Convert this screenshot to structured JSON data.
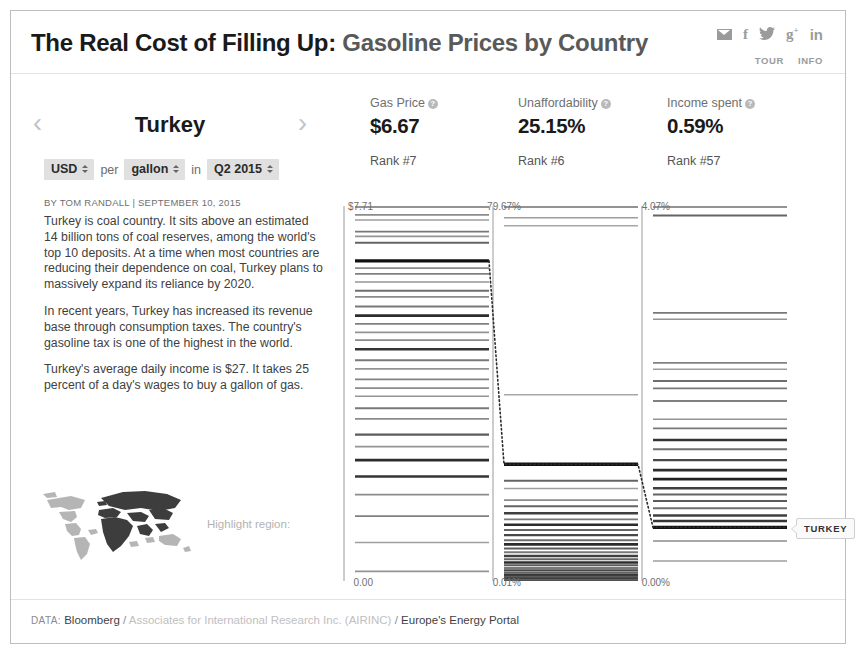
{
  "header": {
    "title_main": "The Real Cost of Filling Up:",
    "title_sub": " Gasoline Prices by Country",
    "social": [
      {
        "name": "mail-icon",
        "label": ""
      },
      {
        "name": "facebook-icon",
        "label": "f"
      },
      {
        "name": "twitter-icon",
        "label": "ᴗ"
      },
      {
        "name": "googleplus-icon",
        "label": "g"
      },
      {
        "name": "linkedin-icon",
        "label": "in"
      }
    ],
    "links": [
      "TOUR",
      "INFO"
    ]
  },
  "left": {
    "prev_arrow": "‹",
    "next_arrow": "›",
    "country": "Turkey",
    "selects": {
      "currency": "USD",
      "per_label": "per",
      "unit": "gallon",
      "in_label": "in",
      "period": "Q2 2015"
    },
    "byline": "BY TOM RANDALL | SEPTEMBER 10, 2015",
    "paragraphs": [
      "Turkey is coal country. It sits above an estimated 14 billion tons of coal reserves, among the world's top 10 deposits. At a time when most countries are reducing their dependence on coal, Turkey plans to massively expand its reliance by 2020.",
      "In recent years, Turkey has increased its revenue base through consumption taxes. The country's gasoline tax is one of the highest in the world.",
      "Turkey's average daily income is $27. It takes 25 percent of a day's wages to buy a gallon of gas."
    ],
    "map_label": "Highlight region:"
  },
  "footer": {
    "key": "DATA:",
    "source1": "Bloomberg",
    "sep1": "/",
    "source2": "Associates for International Research Inc. (AIRINC)",
    "sep2": "/",
    "source3": "Europe's Energy Portal"
  },
  "highlight_tooltip": "TURKEY",
  "chart_data": {
    "type": "table",
    "title": "The Real Cost of Filling Up: Gasoline Prices by Country",
    "subtitle": "Turkey — USD per gallon in Q2 2015",
    "grid": false,
    "legend": "none",
    "highlight_country": "Turkey",
    "columns": [
      {
        "id": "gas_price",
        "label": "Gas Price",
        "value": "$6.67",
        "value_num": 6.67,
        "rank_label": "Rank #7",
        "rank": 7,
        "axis_top": "$7.71",
        "axis_top_num": 7.71,
        "axis_bottom": "0.00",
        "axis_bottom_num": 0.0,
        "ylim": [
          0.0,
          7.71
        ],
        "highlight_value": 6.67,
        "tick_values": [
          7.63,
          7.52,
          7.28,
          7.18,
          7.05,
          6.67,
          6.52,
          6.4,
          6.23,
          6.05,
          5.92,
          5.72,
          5.53,
          5.36,
          5.18,
          5.02,
          4.83,
          4.6,
          4.42,
          4.2,
          4.02,
          3.85,
          3.6,
          3.38,
          3.05,
          2.8,
          2.52,
          2.18,
          1.8,
          1.35,
          0.8,
          0.2
        ],
        "tick_weights": [
          0.35,
          0.25,
          0.45,
          0.3,
          0.55,
          1.0,
          0.35,
          0.4,
          0.3,
          0.5,
          0.35,
          0.45,
          0.85,
          0.4,
          0.3,
          0.35,
          0.8,
          0.45,
          0.3,
          0.4,
          0.35,
          0.3,
          0.45,
          0.35,
          0.6,
          0.3,
          0.85,
          0.8,
          0.35,
          0.4,
          0.25,
          0.3
        ]
      },
      {
        "id": "unaffordability",
        "label": "Unaffordability",
        "value": "25.15%",
        "value_num": 25.15,
        "rank_label": "Rank #6",
        "rank": 6,
        "axis_top": "79.67%",
        "axis_top_num": 79.67,
        "axis_bottom": "0.01%",
        "axis_bottom_num": 0.01,
        "ylim": [
          0.01,
          79.67
        ],
        "highlight_value": 25.15,
        "tick_values": [
          78.2,
          76.5,
          40.1,
          25.15,
          21.6,
          19.9,
          17.4,
          16.1,
          14.6,
          13.3,
          12.1,
          11.0,
          9.9,
          8.8,
          7.9,
          7.0,
          6.2,
          5.4,
          4.7,
          4.0,
          3.4,
          2.8,
          2.3,
          1.8,
          1.3,
          0.9,
          0.5,
          0.2,
          0.05
        ],
        "tick_weights": [
          0.25,
          0.2,
          0.2,
          1.0,
          0.55,
          0.25,
          0.35,
          0.55,
          0.75,
          0.45,
          0.85,
          0.55,
          0.7,
          0.5,
          0.85,
          0.6,
          0.45,
          0.75,
          0.55,
          0.85,
          0.6,
          0.45,
          0.7,
          0.55,
          0.8,
          0.6,
          0.75,
          0.55,
          0.65
        ]
      },
      {
        "id": "income_spent",
        "label": "Income spent",
        "value": "0.59%",
        "value_num": 0.59,
        "rank_label": "Rank #57",
        "rank": 57,
        "axis_top": "4.07%",
        "axis_top_num": 4.07,
        "axis_bottom": "0.00%",
        "axis_bottom_num": 0.0,
        "ylim": [
          0.0,
          4.07
        ],
        "highlight_value": 0.59,
        "tick_values": [
          4.02,
          2.95,
          2.88,
          2.4,
          2.33,
          2.2,
          2.12,
          1.98,
          1.78,
          1.68,
          1.55,
          1.45,
          1.33,
          1.22,
          1.12,
          1.02,
          0.95,
          0.88,
          0.8,
          0.72,
          0.66,
          0.59,
          0.44,
          0.22
        ],
        "tick_weights": [
          0.55,
          0.45,
          0.3,
          0.4,
          0.25,
          0.5,
          0.45,
          0.4,
          0.3,
          0.45,
          0.8,
          0.5,
          0.7,
          0.85,
          0.9,
          0.75,
          0.55,
          0.6,
          0.5,
          0.75,
          0.8,
          1.0,
          0.35,
          0.25
        ]
      }
    ],
    "connector": {
      "style": "dotted",
      "points": [
        [
          0,
          6.67
        ],
        [
          1,
          25.15
        ],
        [
          2,
          0.59
        ]
      ],
      "description": "Dotted line connecting Turkey's position across the three columns"
    }
  }
}
